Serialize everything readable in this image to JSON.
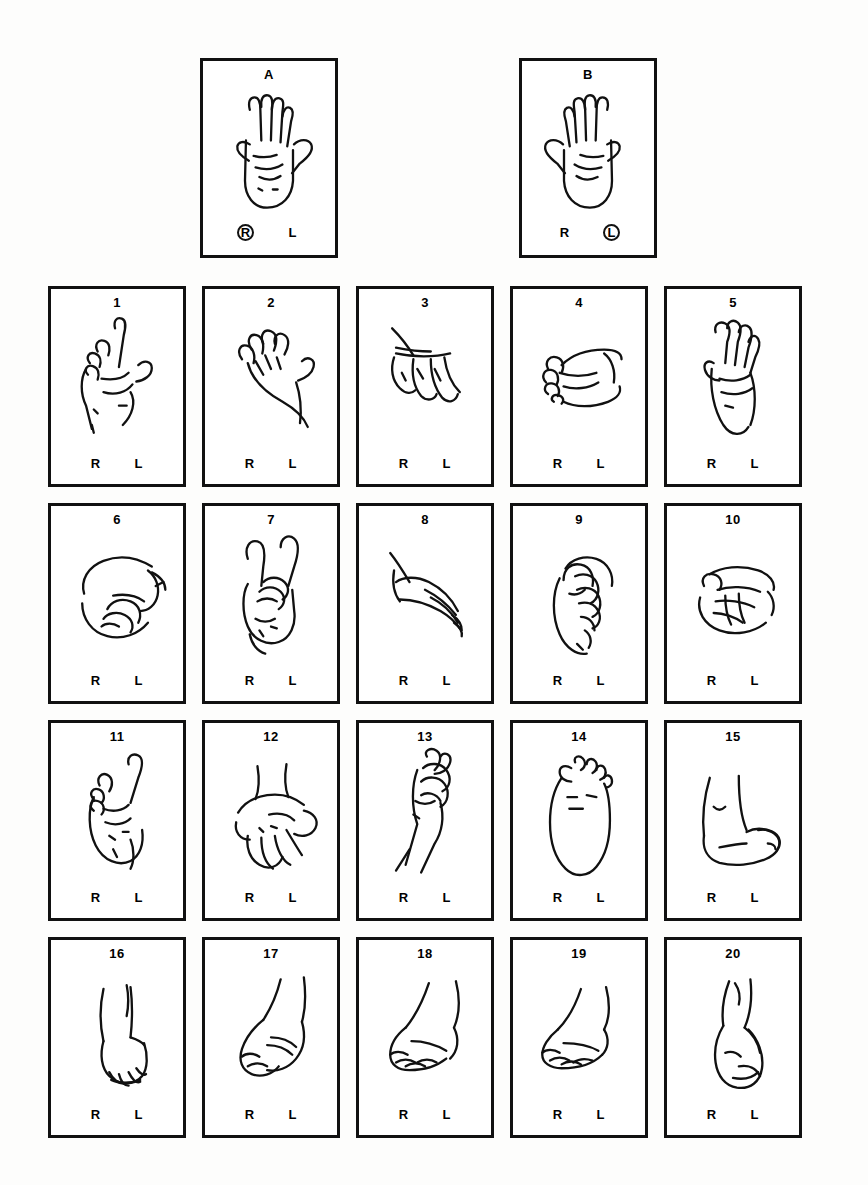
{
  "figure": {
    "kind": "laterality-recognition-test-plate",
    "background_color": "#fdfdfc",
    "ink_color": "#111111"
  },
  "practice": {
    "cards": [
      {
        "label": "A",
        "body_part": "hand",
        "view": "palm-open-fingers-up",
        "left_mark": "R",
        "right_mark": "L",
        "circled": "R"
      },
      {
        "label": "B",
        "body_part": "hand",
        "view": "palm-open-fingers-up-mirrored",
        "left_mark": "R",
        "right_mark": "L",
        "circled": "L"
      }
    ]
  },
  "grid": {
    "columns": 5,
    "rows": 4,
    "left_mark": "R",
    "right_mark": "L",
    "cards": [
      {
        "label": "1",
        "body_part": "hand",
        "view": "fist-index-up-thumb-out"
      },
      {
        "label": "2",
        "body_part": "hand",
        "view": "open-hand-fingers-together-thumb-out"
      },
      {
        "label": "3",
        "body_part": "hand",
        "view": "hand-hanging-fingers-down"
      },
      {
        "label": "4",
        "body_part": "hand",
        "view": "fist-side-view-knuckles-left"
      },
      {
        "label": "5",
        "body_part": "hand",
        "view": "hand-upright-fingers-together"
      },
      {
        "label": "6",
        "body_part": "hand",
        "view": "pinching-hand-thumb-forward"
      },
      {
        "label": "7",
        "body_part": "hand",
        "view": "two-fingers-up-victory"
      },
      {
        "label": "8",
        "body_part": "hand",
        "view": "flat-hand-angled-fingers-down-right"
      },
      {
        "label": "9",
        "body_part": "hand",
        "view": "curled-hand-thumb-over-fingers"
      },
      {
        "label": "10",
        "body_part": "hand",
        "view": "fist-horizontal-thumb-up"
      },
      {
        "label": "11",
        "body_part": "hand",
        "view": "fist-index-up-angled"
      },
      {
        "label": "12",
        "body_part": "hand",
        "view": "open-palm-fingers-spread-down"
      },
      {
        "label": "13",
        "body_part": "hand",
        "view": "forearm-with-pinching-fingers-up"
      },
      {
        "label": "14",
        "body_part": "foot",
        "view": "sole-plantar-view"
      },
      {
        "label": "15",
        "body_part": "foot",
        "view": "foot-profile-medial-toes-right"
      },
      {
        "label": "16",
        "body_part": "foot",
        "view": "foot-front-view-toes-down"
      },
      {
        "label": "17",
        "body_part": "foot",
        "view": "foot-profile-toes-left"
      },
      {
        "label": "18",
        "body_part": "foot",
        "view": "foot-profile-toes-left-lowered"
      },
      {
        "label": "19",
        "body_part": "foot",
        "view": "foot-profile-toes-left-flat"
      },
      {
        "label": "20",
        "body_part": "foot",
        "view": "foot-profile-heel-left-toes-down"
      }
    ]
  }
}
